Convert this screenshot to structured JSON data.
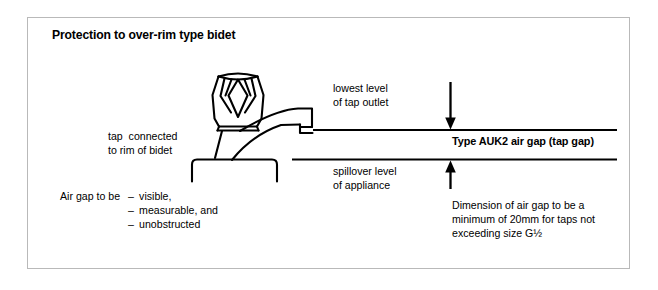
{
  "figure": {
    "title": "Protection to over-rim type bidet",
    "background_color": "#ffffff",
    "frame_color": "#b9b9b9",
    "ink_color": "#000000"
  },
  "labels": {
    "lowest_level_line1": "lowest level",
    "lowest_level_line2": "of tap outlet",
    "tap_connected_line1": "tap  connected",
    "tap_connected_line2": "to rim of bidet",
    "air_gap_type": "Type AUK2 air gap (tap gap)",
    "spillover_line1": "spillover level",
    "spillover_line2": "of appliance",
    "dimension_line1": "Dimension of air gap to be a",
    "dimension_line2": "minimum of 20mm for taps not",
    "dimension_line3": "exceeding size G½"
  },
  "air_gap_requirements": {
    "lead_in": "Air gap to be",
    "dash": "–",
    "items": [
      "visible,",
      "measurable, and",
      "unobstructed"
    ]
  },
  "drawing": {
    "tap_handle_name": "faceted-tap-handle",
    "spout_name": "tap-spout",
    "bidet_rim_name": "bidet-rim",
    "lowest_level_line_name": "lowest-level-of-tap-outlet-line",
    "spillover_line_name": "spillover-level-line",
    "down_arrow_name": "air-gap-down-arrow",
    "up_arrow_name": "air-gap-up-arrow"
  }
}
